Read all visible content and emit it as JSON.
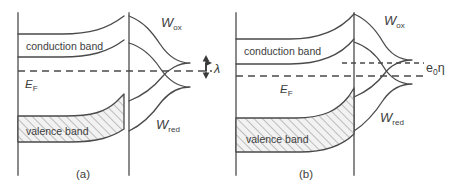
{
  "figure": {
    "type": "semiconductor-electrolyte-energy-band-diagram",
    "background_color": "#ffffff",
    "line_color": "#4a4a4a",
    "axis_color": "#6d6d6d",
    "panels": [
      {
        "id": "a",
        "caption": "(a)",
        "labels": {
          "conduction_band": "conduction band",
          "valence_band": "valence band",
          "fermi_level": "E",
          "fermi_level_sub": "F",
          "w_ox": "W",
          "w_ox_sub": "ox",
          "w_red": "W",
          "w_red_sub": "red",
          "reorganization": "λ"
        },
        "annotations": {
          "has_lambda_arrow": true,
          "has_overpotential": false,
          "band_bending": "moderate",
          "dashed_levels": 1
        }
      },
      {
        "id": "b",
        "caption": "(b)",
        "labels": {
          "conduction_band": "conduction band",
          "valence_band": "valence band",
          "fermi_level": "E",
          "fermi_level_sub": "F",
          "w_ox": "W",
          "w_ox_sub": "ox",
          "w_red": "W",
          "w_red_sub": "red",
          "overpotential": "e",
          "overpotential_sub": "0",
          "overpotential_sym": "η"
        },
        "annotations": {
          "has_lambda_arrow": false,
          "has_overpotential": true,
          "band_bending": "strong",
          "dashed_levels": 2
        }
      }
    ]
  }
}
